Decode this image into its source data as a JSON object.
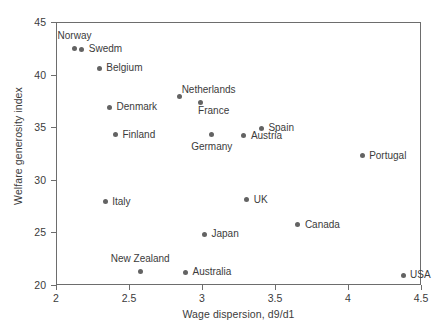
{
  "chart_data": {
    "type": "scatter",
    "title": "",
    "xlabel": "Wage dispersion, d9/d1",
    "ylabel": "Welfare generosity index",
    "xlim": [
      2,
      4.5
    ],
    "ylim": [
      20,
      45
    ],
    "xticks": [
      "2",
      "2.5",
      "3",
      "3.5",
      "4",
      "4.5"
    ],
    "xtick_values": [
      2,
      2.5,
      3,
      3.5,
      4,
      4.5
    ],
    "yticks": [
      "20",
      "25",
      "30",
      "35",
      "40",
      "45"
    ],
    "ytick_values": [
      20,
      25,
      30,
      35,
      40,
      45
    ],
    "grid": false,
    "legend": "none",
    "marker_color": "#636363",
    "axis_color": "#6d6d6d",
    "text_color": "#3b3b3b",
    "points": [
      {
        "label": "Norway",
        "x": 2.12,
        "y": 42.6,
        "label_pos": "above"
      },
      {
        "label": "Swedm",
        "x": 2.17,
        "y": 42.5,
        "label_pos": "right"
      },
      {
        "label": "Belgium",
        "x": 2.29,
        "y": 40.7,
        "label_pos": "right"
      },
      {
        "label": "Denmark",
        "x": 2.36,
        "y": 37.0,
        "label_pos": "right"
      },
      {
        "label": "Finland",
        "x": 2.4,
        "y": 34.4,
        "label_pos": "right"
      },
      {
        "label": "Italy",
        "x": 2.33,
        "y": 28.0,
        "label_pos": "right"
      },
      {
        "label": "New Zealand",
        "x": 2.57,
        "y": 21.4,
        "label_pos": "above"
      },
      {
        "label": "Netherlands",
        "x": 2.84,
        "y": 38.0,
        "label_pos": "above-right"
      },
      {
        "label": "Australia",
        "x": 2.88,
        "y": 21.3,
        "label_pos": "right"
      },
      {
        "label": "France",
        "x": 2.98,
        "y": 37.4,
        "label_pos": "below-right"
      },
      {
        "label": "Japan",
        "x": 3.01,
        "y": 24.9,
        "label_pos": "right"
      },
      {
        "label": "Germany",
        "x": 3.06,
        "y": 34.4,
        "label_pos": "below"
      },
      {
        "label": "Austria",
        "x": 3.28,
        "y": 34.3,
        "label_pos": "right"
      },
      {
        "label": "UK",
        "x": 3.3,
        "y": 28.2,
        "label_pos": "right"
      },
      {
        "label": "Spain",
        "x": 3.4,
        "y": 35.0,
        "label_pos": "right"
      },
      {
        "label": "Canada",
        "x": 3.65,
        "y": 25.8,
        "label_pos": "right"
      },
      {
        "label": "Portugal",
        "x": 4.09,
        "y": 32.4,
        "label_pos": "right"
      },
      {
        "label": "USA",
        "x": 4.37,
        "y": 21.0,
        "label_pos": "right"
      }
    ]
  }
}
